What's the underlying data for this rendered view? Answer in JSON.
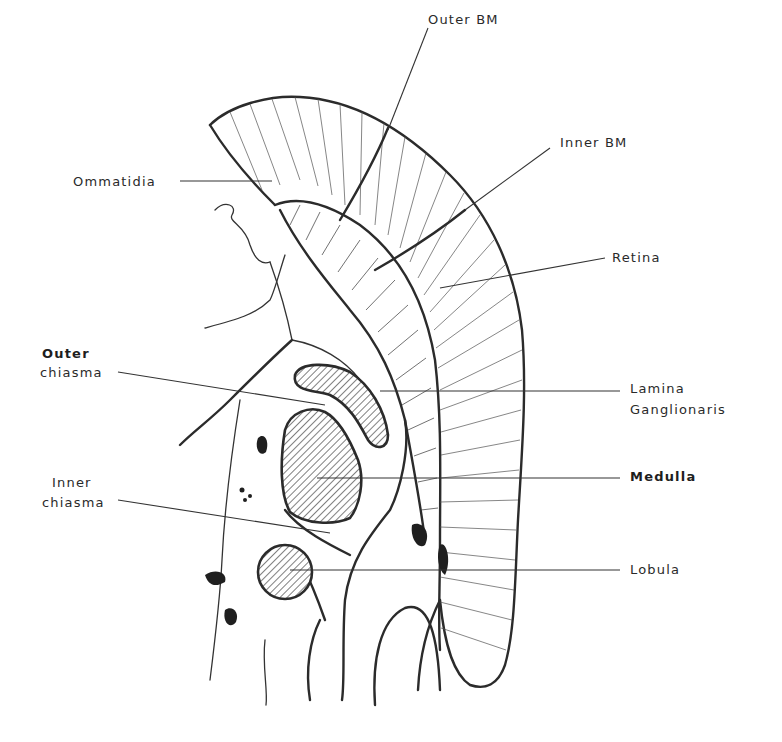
{
  "figure": {
    "labels": {
      "outer_bm": "Outer BM",
      "inner_bm": "Inner BM",
      "ommatidia": "Ommatidia",
      "retina": "Retina",
      "outer_chiasma_line1": "Outer",
      "outer_chiasma_line2": "chiasma",
      "lamina_line1": "Lamina",
      "lamina_line2": "Ganglionaris",
      "medulla": "Medulla",
      "inner_chiasma_line1": "Inner",
      "inner_chiasma_line2": "chiasma",
      "lobula": "Lobula"
    },
    "colors": {
      "ink": "#2b2b2b",
      "background": "#ffffff"
    }
  }
}
